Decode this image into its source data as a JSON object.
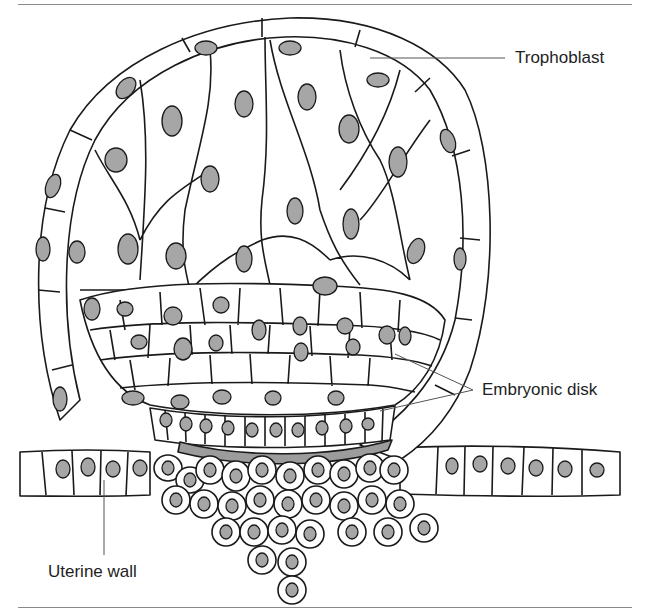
{
  "figure": {
    "labels": {
      "trophoblast": "Trophoblast",
      "embryonic_disk": "Embryonic disk",
      "uterine_wall": "Uterine wall"
    },
    "leaders": {
      "trophoblast": [
        [
          370,
          58
        ],
        [
          505,
          58
        ]
      ],
      "embryonic_disk_1": [
        [
          395,
          354
        ],
        [
          473,
          390
        ]
      ],
      "embryonic_disk_2": [
        [
          380,
          411
        ],
        [
          473,
          390
        ]
      ],
      "uterine_wall": [
        [
          104,
          480
        ],
        [
          104,
          555
        ]
      ]
    },
    "colors": {
      "outline": "#1a1a1a",
      "nucleus_fill": "#a6a6a6",
      "hypoblast_fill": "#9c9c9c",
      "cell_fill": "#ffffff",
      "leader": "#555555",
      "rule": "#8a8a8a"
    }
  }
}
